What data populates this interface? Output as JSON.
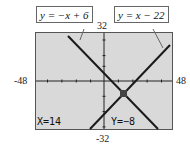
{
  "window": {
    "xmin": "-48",
    "xmax": "48",
    "ymin": "-32",
    "ymax": "32"
  },
  "callouts": [
    {
      "text": "y = −x + 6"
    },
    {
      "text": "y = x − 22"
    }
  ],
  "readout": {
    "x": "X=14",
    "y": "Y=−8"
  },
  "equations": [
    {
      "expr": "y = -x + 6",
      "slope": -1,
      "intercept": 6
    },
    {
      "expr": "y = x - 22",
      "slope": 1,
      "intercept": -22
    }
  ],
  "intersection": {
    "x": 14,
    "y": -8
  },
  "colors": {
    "screen": "#d9d9d9",
    "line": "#1a1a1a",
    "cursor": "#444444"
  }
}
